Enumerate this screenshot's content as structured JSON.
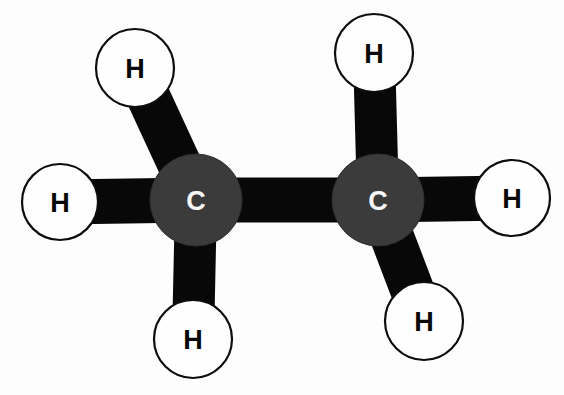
{
  "figure": {
    "molecule_name": "Ethane",
    "molecular_formula": "C2H6",
    "background_color": "#fdfdfd",
    "width": 564,
    "height": 395
  },
  "palette": {
    "carbon_fill": "#3b3b3b",
    "carbon_stroke": "#2e2e2e",
    "carbon_label_color": "#f6f6f6",
    "hydrogen_fill": "#fefefe",
    "hydrogen_stroke": "#0d0d0d",
    "hydrogen_label_color": "#080808",
    "bond_color": "#080808"
  },
  "diagram": {
    "type": "ball-and-stick",
    "atoms": [
      {
        "id": "C1",
        "element": "C",
        "label": "C",
        "kind": "carbon",
        "cx": 196,
        "cy": 200,
        "r": 46
      },
      {
        "id": "C2",
        "element": "C",
        "label": "C",
        "kind": "carbon",
        "cx": 378,
        "cy": 200,
        "r": 46
      },
      {
        "id": "H1",
        "element": "H",
        "label": "H",
        "kind": "hydrogen",
        "cx": 135,
        "cy": 68,
        "r": 39
      },
      {
        "id": "H2",
        "element": "H",
        "label": "H",
        "kind": "hydrogen",
        "cx": 60,
        "cy": 202,
        "r": 38
      },
      {
        "id": "H3",
        "element": "H",
        "label": "H",
        "kind": "hydrogen",
        "cx": 193,
        "cy": 339,
        "r": 39
      },
      {
        "id": "H4",
        "element": "H",
        "label": "H",
        "kind": "hydrogen",
        "cx": 374,
        "cy": 53,
        "r": 39
      },
      {
        "id": "H5",
        "element": "H",
        "label": "H",
        "kind": "hydrogen",
        "cx": 512,
        "cy": 198,
        "r": 38
      },
      {
        "id": "H6",
        "element": "H",
        "label": "H",
        "kind": "hydrogen",
        "cx": 424,
        "cy": 321,
        "r": 39
      }
    ],
    "bonds": [
      {
        "id": "bond-c1-c2",
        "from": "C1",
        "to": "C2",
        "order": 1,
        "thickness": 45
      },
      {
        "id": "bond-c1-h1",
        "from": "C1",
        "to": "H1",
        "order": 1,
        "thickness": 44
      },
      {
        "id": "bond-c1-h2",
        "from": "C1",
        "to": "H2",
        "order": 1,
        "thickness": 45
      },
      {
        "id": "bond-c1-h3",
        "from": "C1",
        "to": "H3",
        "order": 1,
        "thickness": 42
      },
      {
        "id": "bond-c2-h4",
        "from": "C2",
        "to": "H4",
        "order": 1,
        "thickness": 42
      },
      {
        "id": "bond-c2-h5",
        "from": "C2",
        "to": "H5",
        "order": 1,
        "thickness": 45
      },
      {
        "id": "bond-c2-h6",
        "from": "C2",
        "to": "H6",
        "order": 1,
        "thickness": 44
      }
    ]
  }
}
